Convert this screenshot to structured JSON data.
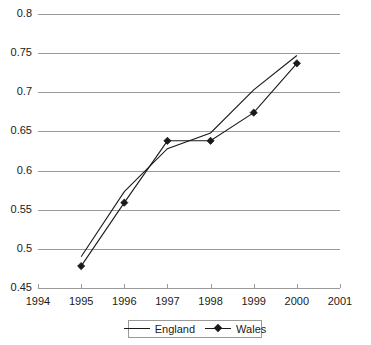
{
  "chart_data": {
    "type": "line",
    "title": "",
    "xlabel": "",
    "ylabel": "",
    "x": [
      1995,
      1996,
      1997,
      1998,
      1999,
      2000
    ],
    "xlim": [
      1994,
      2001
    ],
    "ylim": [
      0.45,
      0.8
    ],
    "grid": true,
    "legend_position": "bottom",
    "x_ticks": [
      "1994",
      "1995",
      "1996",
      "1997",
      "1998",
      "1999",
      "2000",
      "2001"
    ],
    "y_ticks": [
      "0.45",
      "0.5",
      "0.55",
      "0.6",
      "0.65",
      "0.7",
      "0.75",
      "0.8"
    ],
    "series": [
      {
        "name": "England",
        "marker": "none",
        "color": "#1a1a1a",
        "values": [
          0.49,
          0.573,
          0.628,
          0.648,
          0.703,
          0.747
        ]
      },
      {
        "name": "Wales",
        "marker": "diamond",
        "color": "#1a1a1a",
        "values": [
          0.478,
          0.559,
          0.638,
          0.638,
          0.674,
          0.737
        ]
      }
    ]
  },
  "axes": {
    "y_ticks": [
      {
        "label": "0.8",
        "value": 0.8
      },
      {
        "label": "0.75",
        "value": 0.75
      },
      {
        "label": "0.7",
        "value": 0.7
      },
      {
        "label": "0.65",
        "value": 0.65
      },
      {
        "label": "0.6",
        "value": 0.6
      },
      {
        "label": "0.55",
        "value": 0.55
      },
      {
        "label": "0.5",
        "value": 0.5
      },
      {
        "label": "0.45",
        "value": 0.45
      }
    ],
    "x_ticks": [
      {
        "label": "1994",
        "value": 1994
      },
      {
        "label": "1995",
        "value": 1995
      },
      {
        "label": "1996",
        "value": 1996
      },
      {
        "label": "1997",
        "value": 1997
      },
      {
        "label": "1998",
        "value": 1998
      },
      {
        "label": "1999",
        "value": 1999
      },
      {
        "label": "2000",
        "value": 2000
      },
      {
        "label": "2001",
        "value": 2001
      }
    ]
  },
  "legend": {
    "entries": [
      {
        "label": "England",
        "marker": "none"
      },
      {
        "label": "Wales",
        "marker": "diamond"
      }
    ]
  },
  "style": {
    "grid_color": "#9a9a9a",
    "line_color": "#1a1a1a",
    "background": "#ffffff"
  }
}
